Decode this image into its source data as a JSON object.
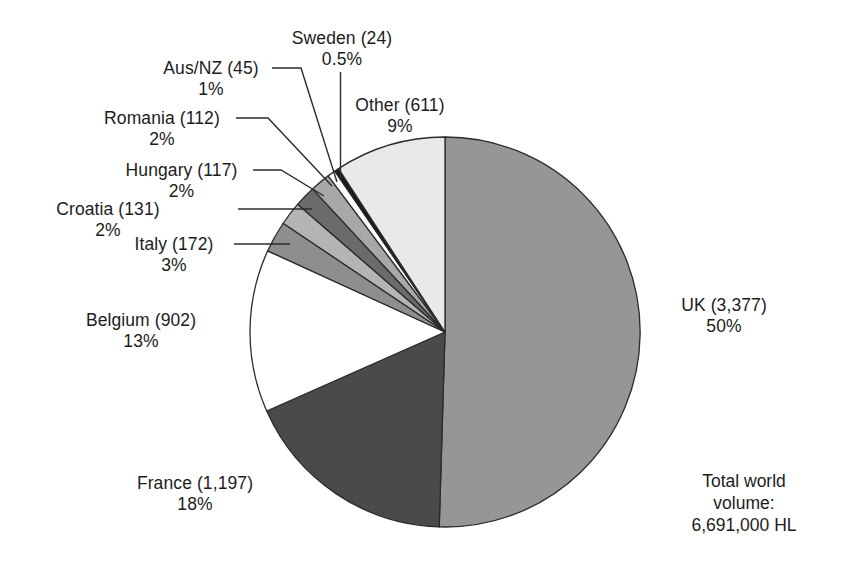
{
  "chart_data": {
    "type": "pie",
    "title": "",
    "subtitle": "",
    "xlabel": "",
    "ylabel": "",
    "legend_position": "none",
    "grid": false,
    "units": "HL (thousands)",
    "total_label_lines": [
      "Total world",
      "volume:",
      "6,691,000 HL"
    ],
    "total_value": "6,691,000 HL",
    "categories": [
      "UK",
      "France",
      "Belgium",
      "Italy",
      "Croatia",
      "Hungary",
      "Romania",
      "Aus/NZ",
      "Sweden",
      "Other"
    ],
    "values": [
      3377,
      1197,
      902,
      172,
      131,
      117,
      112,
      45,
      24,
      611
    ],
    "percents": [
      50,
      18,
      13,
      3,
      2,
      2,
      2,
      1,
      0.5,
      9
    ],
    "percent_labels": [
      "50%",
      "18%",
      "13%",
      "3%",
      "2%",
      "2%",
      "2%",
      "1%",
      "0.5%",
      "9%"
    ],
    "value_labels": [
      "3,377",
      "1,197",
      "902",
      "172",
      "131",
      "117",
      "112",
      "45",
      "24",
      "611"
    ],
    "slice_colors": [
      "#969696",
      "#4a4a4a",
      "#ffffff",
      "#8e8e8e",
      "#b4b4b4",
      "#6b6b6b",
      "#a8a8a8",
      "#ffffff",
      "#1a1a1a",
      "#e9e9e9"
    ],
    "slices": [
      {
        "name": "UK",
        "label": "UK (3,377)",
        "percent_label": "50%",
        "value": 3377,
        "percent": 50,
        "color": "#969696",
        "start_deg": 0,
        "end_deg": 181.7
      },
      {
        "name": "France",
        "label": "France (1,197)",
        "percent_label": "18%",
        "value": 1197,
        "percent": 18,
        "color": "#4a4a4a",
        "start_deg": 181.7,
        "end_deg": 246.1
      },
      {
        "name": "Belgium",
        "label": "Belgium (902)",
        "percent_label": "13%",
        "value": 902,
        "percent": 13,
        "color": "#ffffff",
        "start_deg": 246.1,
        "end_deg": 294.6
      },
      {
        "name": "Italy",
        "label": "Italy (172)",
        "percent_label": "3%",
        "value": 172,
        "percent": 3,
        "color": "#8e8e8e",
        "start_deg": 294.6,
        "end_deg": 303.9
      },
      {
        "name": "Croatia",
        "label": "Croatia (131)",
        "percent_label": "2%",
        "value": 131,
        "percent": 2,
        "color": "#b4b4b4",
        "start_deg": 303.9,
        "end_deg": 310.9
      },
      {
        "name": "Hungary",
        "label": "Hungary (117)",
        "percent_label": "2%",
        "value": 117,
        "percent": 2,
        "color": "#6b6b6b",
        "start_deg": 310.9,
        "end_deg": 317.2
      },
      {
        "name": "Romania",
        "label": "Romania (112)",
        "percent_label": "2%",
        "value": 112,
        "percent": 2,
        "color": "#a8a8a8",
        "start_deg": 317.2,
        "end_deg": 323.2
      },
      {
        "name": "Aus/NZ",
        "label": "Aus/NZ (45)",
        "percent_label": "1%",
        "value": 45,
        "percent": 1,
        "color": "#ffffff",
        "start_deg": 323.2,
        "end_deg": 325.6
      },
      {
        "name": "Sweden",
        "label": "Sweden (24)",
        "percent_label": "0.5%",
        "value": 24,
        "percent": 0.5,
        "color": "#1a1a1a",
        "start_deg": 325.6,
        "end_deg": 326.9
      },
      {
        "name": "Other",
        "label": "Other (611)",
        "percent_label": "9%",
        "value": 611,
        "percent": 9,
        "color": "#e9e9e9",
        "start_deg": 326.9,
        "end_deg": 360
      }
    ]
  },
  "labels": {
    "sweden": {
      "line1": "Sweden (24)",
      "line2": "0.5%"
    },
    "ausnz": {
      "line1": "Aus/NZ (45)",
      "line2": "1%"
    },
    "romania": {
      "line1": "Romania (112)",
      "line2": "2%"
    },
    "hungary": {
      "line1": "Hungary (117)",
      "line2": "2%"
    },
    "croatia": {
      "line1": "Croatia (131)",
      "line2": "2%"
    },
    "italy": {
      "line1": "Italy (172)",
      "line2": "3%"
    },
    "belgium": {
      "line1": "Belgium (902)",
      "line2": "13%"
    },
    "france": {
      "line1": "France (1,197)",
      "line2": "18%"
    },
    "other": {
      "line1": "Other (611)",
      "line2": "9%"
    },
    "uk": {
      "line1": "UK (3,377)",
      "line2": "50%"
    }
  },
  "total": {
    "line1": "Total world",
    "line2": "volume:",
    "line3": "6,691,000 HL"
  },
  "style": {
    "stroke": "#2b2b2b",
    "background": "#ffffff",
    "text_color": "#1c1c1c"
  }
}
